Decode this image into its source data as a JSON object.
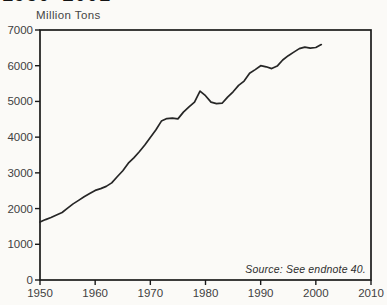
{
  "page": {
    "title_fragment": "1950–2001",
    "y_axis_label": "Million Tons",
    "source_note": "Source: See endnote 40."
  },
  "colors": {
    "background": "#fbfaf7",
    "line": "#262626",
    "axis": "#1a1a1a",
    "tick_text": "#414141"
  },
  "chart_data": {
    "type": "line",
    "title": "1950–2001",
    "xlabel": "",
    "ylabel": "Million Tons",
    "xlim": [
      1950,
      2010
    ],
    "ylim": [
      0,
      7000
    ],
    "xticks": [
      1950,
      1960,
      1970,
      1980,
      1990,
      2000,
      2010
    ],
    "yticks": [
      0,
      1000,
      2000,
      3000,
      4000,
      5000,
      6000,
      7000
    ],
    "grid": false,
    "legend": null,
    "source": "Source: See endnote 40.",
    "series": [
      {
        "name": "Million Tons",
        "x": [
          1950,
          1951,
          1952,
          1953,
          1954,
          1955,
          1956,
          1957,
          1958,
          1959,
          1960,
          1961,
          1962,
          1963,
          1964,
          1965,
          1966,
          1967,
          1968,
          1969,
          1970,
          1971,
          1972,
          1973,
          1974,
          1975,
          1976,
          1977,
          1978,
          1979,
          1980,
          1981,
          1982,
          1983,
          1984,
          1985,
          1986,
          1987,
          1988,
          1989,
          1990,
          1991,
          1992,
          1993,
          1994,
          1995,
          1996,
          1997,
          1998,
          1999,
          2000,
          2001
        ],
        "values": [
          1620,
          1690,
          1750,
          1820,
          1890,
          2010,
          2130,
          2230,
          2330,
          2420,
          2510,
          2560,
          2620,
          2720,
          2890,
          3060,
          3270,
          3420,
          3590,
          3780,
          3990,
          4200,
          4450,
          4520,
          4530,
          4510,
          4700,
          4850,
          4980,
          5290,
          5160,
          4980,
          4940,
          4950,
          5120,
          5270,
          5450,
          5570,
          5790,
          5890,
          6000,
          5970,
          5920,
          5990,
          6160,
          6280,
          6380,
          6480,
          6520,
          6490,
          6510,
          6590
        ]
      }
    ]
  }
}
